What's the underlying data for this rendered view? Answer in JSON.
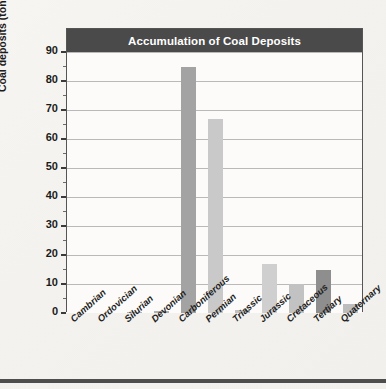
{
  "chart_data": {
    "type": "bar",
    "title": "Accumulation of Coal Deposits",
    "xlabel": "",
    "ylabel": "Coal deposits (tons per year)",
    "ylim": [
      0,
      90
    ],
    "ytick_step": 10,
    "yticks": [
      0,
      10,
      20,
      30,
      40,
      50,
      60,
      70,
      80,
      90
    ],
    "ytick_labels": [
      "0",
      "10",
      "20",
      "30",
      "40",
      "50",
      "60",
      "70",
      "80",
      "90"
    ],
    "grid": true,
    "legend": null,
    "categories": [
      "Cambrian",
      "Ordovician",
      "Silurian",
      "Devonian",
      "Carboniferous",
      "Permian",
      "Triassic",
      "Jurassic",
      "Cretaceous",
      "Tertiary",
      "Quaternary"
    ],
    "values": [
      0,
      0,
      0.3,
      0.6,
      85,
      67,
      1.2,
      17,
      10,
      15,
      3
    ],
    "bar_colors": [
      "#b5b5b5",
      "#b5b5b5",
      "#b5b5b5",
      "#b0b0b0",
      "#a3a3a3",
      "#c9c9c9",
      "#c0c0c0",
      "#cfcfcf",
      "#c2c2c2",
      "#8e8e8e",
      "#bdbdbd"
    ]
  },
  "style": {
    "title_bar_color": "#4a4a4a",
    "title_text_color": "#ffffff",
    "plot_background": "#fcfbf9",
    "page_background": "#f6f4f0",
    "gridline_color": "#b9b9b9",
    "axis_color": "#555555",
    "text_color": "#1b1b1b"
  }
}
